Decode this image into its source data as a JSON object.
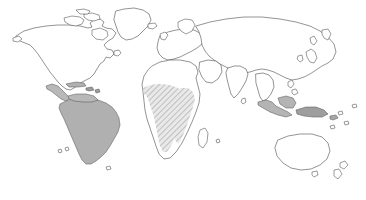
{
  "map": {
    "title": "World Distribution Map",
    "projection": "equirectangular",
    "background_color": "#ffffff",
    "outline_color": "#3a3a3a",
    "width": 366,
    "height": 200,
    "legend_visible": false,
    "labels_visible": false,
    "graticule_visible": false,
    "regions": [
      {
        "id": "south-america",
        "name": "South America",
        "fill_style": "solid",
        "fill_color": "#b0b0b0",
        "stroke_color": "#5a5a5a",
        "highlighted": true
      },
      {
        "id": "central-america-caribbean",
        "name": "Central America and Caribbean",
        "fill_style": "solid",
        "fill_color": "#b8b8b8",
        "stroke_color": "#6a6a6a",
        "highlighted": true
      },
      {
        "id": "sub-saharan-africa-band",
        "name": "Sub-Saharan Africa",
        "fill_style": "hatched",
        "fill_color": "#cfcfcf",
        "hatch_color": "#9a9a9a",
        "hatch_angle_degrees": 45,
        "highlighted": true
      },
      {
        "id": "indonesia-new-guinea",
        "name": "Indonesia and New Guinea",
        "fill_style": "solid",
        "fill_color": "#b4b4b4",
        "stroke_color": "#6a6a6a",
        "highlighted": true
      }
    ],
    "unhighlighted_continents": [
      "North America",
      "Europe",
      "Asia",
      "Australia",
      "Greenland"
    ]
  }
}
